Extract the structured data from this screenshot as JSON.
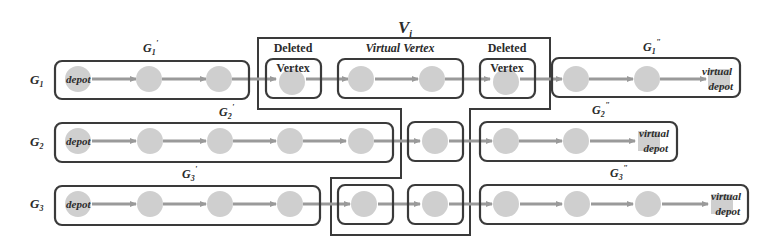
{
  "figure": {
    "group_label": {
      "text": "V",
      "sub": "i"
    },
    "section_labels": [
      {
        "id": "deleted-1",
        "line1": "Deleted",
        "line2": "Vertex"
      },
      {
        "id": "virtual-vertex",
        "line1": "Virtual Vertex"
      },
      {
        "id": "deleted-2",
        "line1": "Deleted",
        "line2": "Vertex"
      }
    ],
    "rows": [
      {
        "name": "G",
        "sub": "1",
        "prefix_label": {
          "name": "G",
          "sub": "1",
          "sup": "'"
        },
        "suffix_label": {
          "name": "G",
          "sub": "1",
          "sup": "\""
        },
        "start_node_text": "depot",
        "end_node_text": [
          "virtual",
          "depot"
        ]
      },
      {
        "name": "G",
        "sub": "2",
        "prefix_label": {
          "name": "G",
          "sub": "2",
          "sup": "'"
        },
        "suffix_label": {
          "name": "G",
          "sub": "2",
          "sup": "\""
        },
        "start_node_text": "depot",
        "end_node_text": [
          "virtual",
          "depot"
        ]
      },
      {
        "name": "G",
        "sub": "3",
        "prefix_label": {
          "name": "G",
          "sub": "3",
          "sup": "'"
        },
        "suffix_label": {
          "name": "G",
          "sub": "3",
          "sup": "\""
        },
        "start_node_text": "depot",
        "end_node_text": [
          "virtual",
          "depot"
        ]
      }
    ],
    "colors": {
      "node_fill": "#cfcfcf",
      "edge": "#9a9a9a",
      "box_stroke": "#3a3a3a",
      "text": "#2b2b2b"
    }
  }
}
